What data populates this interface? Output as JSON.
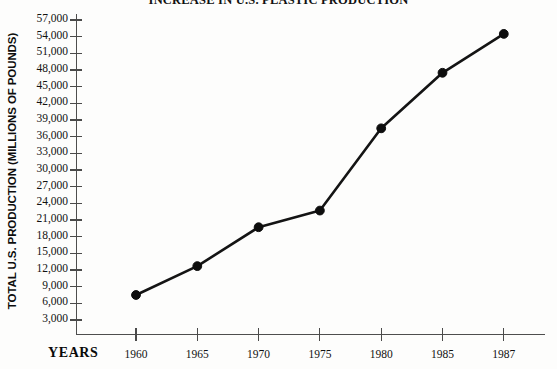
{
  "chart_data": {
    "type": "line",
    "title": "INCREASE IN U.S. PLASTIC PRODUCTION",
    "xlabel": "YEARS",
    "ylabel": "TOTAL U.S. PRODUCTION (MILLIONS OF POUNDS)",
    "x": [
      1960,
      1965,
      1970,
      1975,
      1980,
      1985,
      1987
    ],
    "categories": [
      "1960",
      "1965",
      "1970",
      "1975",
      "1980",
      "1985",
      "1987"
    ],
    "values": [
      7500,
      12700,
      19700,
      22700,
      37500,
      47500,
      54500
    ],
    "series": [
      {
        "name": "Total U.S. plastic production",
        "values": [
          7500,
          12700,
          19700,
          22700,
          37500,
          47500,
          54500
        ]
      }
    ],
    "ylim": [
      0,
      58500
    ],
    "ytick_values": [
      3000,
      6000,
      9000,
      12000,
      15000,
      18000,
      21000,
      24000,
      27000,
      30000,
      33000,
      36000,
      39000,
      42000,
      45000,
      48000,
      51000,
      54000,
      57000
    ],
    "ytick_labels": [
      "3,000",
      "6,000",
      "9,000",
      "12,000",
      "15,000",
      "18,000",
      "21,000",
      "24,000",
      "27,000",
      "30,000",
      "33,000",
      "36,000",
      "39,000",
      "42,000",
      "45,000",
      "48,000",
      "51,000",
      "54,000",
      "57,000"
    ],
    "xtick_labels": [
      "1960",
      "1965",
      "1970",
      "1975",
      "1980",
      "1985",
      "1987"
    ],
    "grid": false,
    "legend": false,
    "legend_position": "none",
    "marker": "filled-circle",
    "line_color": "#141414",
    "marker_color": "#0d0d0d",
    "axis_color": "#4a4a4a",
    "background_color": "#fdfdfc"
  }
}
